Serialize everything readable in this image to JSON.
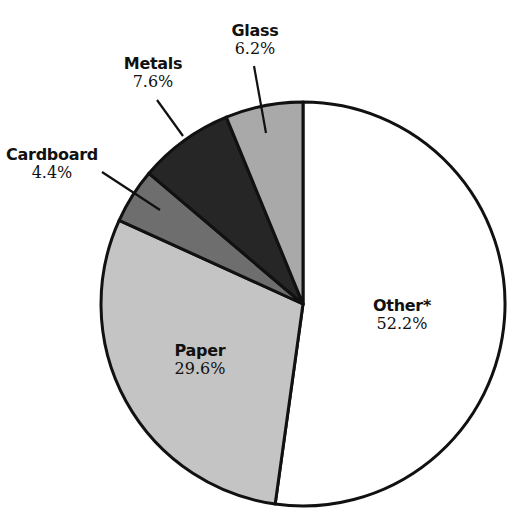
{
  "chart_data": {
    "type": "pie",
    "title": "",
    "start_angle_deg": 0,
    "direction": "clockwise",
    "slices": [
      {
        "label": "Other*",
        "value": 52.2,
        "display": "52.2%",
        "fill": "#ffffff"
      },
      {
        "label": "Paper",
        "value": 29.6,
        "display": "29.6%",
        "fill": "#c4c4c4"
      },
      {
        "label": "Cardboard",
        "value": 4.4,
        "display": "4.4%",
        "fill": "#6e6e6e"
      },
      {
        "label": "Metals",
        "value": 7.6,
        "display": "7.6%",
        "fill": "#262626"
      },
      {
        "label": "Glass",
        "value": 6.2,
        "display": "6.2%",
        "fill": "#a9a9a9"
      }
    ],
    "legend": "none",
    "labels": "inline and callout"
  },
  "labels": {
    "other": {
      "name": "Other*",
      "pct": "52.2%"
    },
    "paper": {
      "name": "Paper",
      "pct": "29.6%"
    },
    "cardboard": {
      "name": "Cardboard",
      "pct": "4.4%"
    },
    "metals": {
      "name": "Metals",
      "pct": "7.6%"
    },
    "glass": {
      "name": "Glass",
      "pct": "6.2%"
    }
  }
}
